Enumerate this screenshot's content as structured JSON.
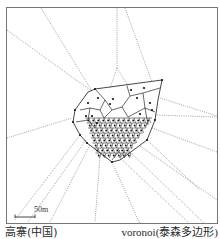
{
  "figure": {
    "site_name": "高寨(中国)",
    "method_label": "voronoi(泰森多边形)",
    "scale_bar": {
      "label": "50m",
      "distance_m": 50
    },
    "colors": {
      "frame": "#777777",
      "hull": "#333333",
      "cells": "#222222",
      "rays": "#8a8a8a",
      "points": "#111111"
    }
  }
}
